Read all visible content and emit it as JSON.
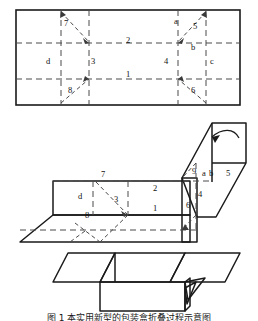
{
  "figure": {
    "caption": "图 1  本实用新型的包装盒折叠过程示意图",
    "line_color": "#1a1a1a",
    "dash_color": "#444444",
    "background": "#ffffff"
  },
  "views": [
    {
      "id": "blank",
      "name": "flat-blank-view",
      "description": "Flat carton blank with dashed crease lines",
      "labels": [
        {
          "text": "7",
          "x": 64,
          "y": 22,
          "italic": false
        },
        {
          "text": "a",
          "x": 176,
          "y": 21,
          "italic": false
        },
        {
          "text": "5",
          "x": 196,
          "y": 26,
          "italic": false
        },
        {
          "text": "2",
          "x": 128,
          "y": 40,
          "italic": false
        },
        {
          "text": "b",
          "x": 193,
          "y": 46,
          "italic": false
        },
        {
          "text": "d",
          "x": 47,
          "y": 62,
          "italic": false
        },
        {
          "text": "3",
          "x": 85,
          "y": 62,
          "italic": false
        },
        {
          "text": "4",
          "x": 164,
          "y": 62,
          "italic": false
        },
        {
          "text": "c",
          "x": 212,
          "y": 62,
          "italic": false
        },
        {
          "text": "1",
          "x": 128,
          "y": 73,
          "italic": false
        },
        {
          "text": "8",
          "x": 68,
          "y": 92,
          "italic": false
        },
        {
          "text": "6",
          "x": 196,
          "y": 92,
          "italic": false
        }
      ]
    },
    {
      "id": "folding",
      "name": "partially-folded-view",
      "description": "Carton partly erected, arrow shows folding direction",
      "labels": [
        {
          "text": "7",
          "x": 101,
          "y": 174,
          "italic": false
        },
        {
          "text": "9",
          "x": 193,
          "y": 170,
          "italic": false
        },
        {
          "text": "a",
          "x": 203,
          "y": 173,
          "italic": false
        },
        {
          "text": "b",
          "x": 211,
          "y": 173,
          "italic": false
        },
        {
          "text": "5",
          "x": 228,
          "y": 173,
          "italic": false
        },
        {
          "text": "d",
          "x": 79,
          "y": 196,
          "italic": false
        },
        {
          "text": "2",
          "x": 155,
          "y": 188,
          "italic": false
        },
        {
          "text": "3",
          "x": 114,
          "y": 199,
          "italic": false
        },
        {
          "text": "4",
          "x": 199,
          "y": 194,
          "italic": false
        },
        {
          "text": "1",
          "x": 155,
          "y": 208,
          "italic": false
        },
        {
          "text": "6",
          "x": 187,
          "y": 205,
          "italic": false
        },
        {
          "text": "8",
          "x": 85,
          "y": 215,
          "italic": false
        }
      ]
    },
    {
      "id": "assembled",
      "name": "assembled-box-view",
      "description": "Finished box with flaps open",
      "labels": []
    }
  ]
}
